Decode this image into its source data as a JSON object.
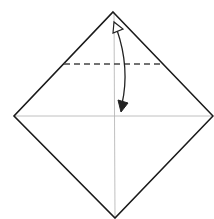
{
  "diagram": {
    "type": "origami-fold-step",
    "colors": {
      "background": "#ffffff",
      "edge": "#1a1a1a",
      "crease": "#b0b0b0",
      "fold_line": "#444444",
      "arrow": "#222222"
    },
    "square": {
      "top": [
        113,
        12
      ],
      "right": [
        213,
        116
      ],
      "bottom": [
        115,
        218
      ],
      "left": [
        14,
        116
      ]
    },
    "creases": [
      {
        "name": "vertical-crease",
        "from": [
          114,
          12
        ],
        "to": [
          115,
          218
        ]
      },
      {
        "name": "horizontal-crease",
        "from": [
          14,
          116
        ],
        "to": [
          213,
          116
        ]
      }
    ],
    "valley_fold_line": {
      "from": [
        64,
        64
      ],
      "to": [
        163,
        64
      ],
      "style": "dashed"
    },
    "arrow": {
      "description": "fold top corner down to center and unfold",
      "start": [
        117,
        28
      ],
      "end": [
        122,
        110
      ]
    }
  }
}
